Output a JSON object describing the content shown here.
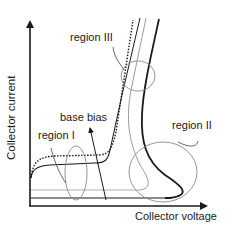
{
  "axes": {
    "x_label": "Collector voltage",
    "y_label": "Collector current"
  },
  "annotations": {
    "region_1": "region I",
    "region_2": "region II",
    "region_3": "region III",
    "base_bias": "base bias"
  },
  "colors": {
    "axis": "#1a1a1a",
    "curve_dark": "#1a1a1a",
    "curve_light": "#9a9a9a",
    "ellipse": "#8a8a8a"
  }
}
